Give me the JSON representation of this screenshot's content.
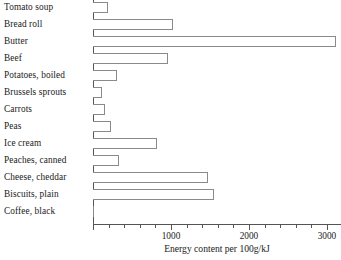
{
  "chart_data": {
    "type": "bar",
    "orientation": "horizontal",
    "title": "",
    "xlabel": "Energy content per 100g/kJ",
    "ylabel": "",
    "xlim": [
      0,
      3180
    ],
    "ylim": null,
    "grid": false,
    "legend": null,
    "xticks": [
      0,
      1000,
      2000,
      3000
    ],
    "xtick_labels": [
      "",
      "1000",
      "2000",
      "3000"
    ],
    "xminor_tick_step": 200,
    "categories": [
      "Tomato soup",
      "Bread roll",
      "Butter",
      "Beef",
      "Potatoes, boiled",
      "Brussels sprouts",
      "Carrots",
      "Peas",
      "Ice cream",
      "Peaches, canned",
      "Cheese, cheddar",
      "Biscuits, plain",
      "Coffee, black"
    ],
    "values": [
      190,
      1030,
      3120,
      960,
      310,
      110,
      150,
      230,
      820,
      330,
      1470,
      1550,
      10
    ]
  },
  "style": {
    "bar_fill": "#ffffff",
    "bar_stroke": "#8a8a8a",
    "axis_color": "#555555",
    "text_color": "#1a1a1a",
    "background": "#ffffff"
  }
}
